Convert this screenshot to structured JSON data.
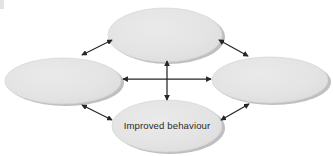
{
  "diagram": {
    "background_color": "#ffffff",
    "node_fill_color": "#e4e4e4",
    "node_shadow_color": "#bdbdbd",
    "node_stroke_color": "#d2d2d2",
    "arrow_color": "#262626",
    "label_color": "#2b2b2b",
    "nodes": [
      {
        "id": "top",
        "label": "",
        "cx": 165,
        "cy": 35,
        "rx": 57,
        "ry": 27
      },
      {
        "id": "left",
        "label": "",
        "cx": 63,
        "cy": 81,
        "rx": 58,
        "ry": 23
      },
      {
        "id": "right",
        "label": "",
        "cx": 270,
        "cy": 80,
        "rx": 58,
        "ry": 23
      },
      {
        "id": "bottom",
        "label": "Improved behaviour",
        "cx": 167,
        "cy": 126,
        "rx": 55,
        "ry": 26
      }
    ],
    "connectors": [
      {
        "id": "center-horizontal",
        "kind": "double-headed-arrow",
        "from": "left",
        "to": "right",
        "x1": 123,
        "y1": 79,
        "x2": 211,
        "y2": 79
      },
      {
        "id": "center-vertical",
        "kind": "double-headed-arrow",
        "from": "top",
        "to": "bottom",
        "x1": 167,
        "y1": 61,
        "x2": 167,
        "y2": 100
      },
      {
        "id": "top-left-diagonal",
        "kind": "double-headed-arrow",
        "from": "left",
        "to": "top",
        "x1": 82,
        "y1": 55,
        "x2": 112,
        "y2": 40
      },
      {
        "id": "top-right-diagonal",
        "kind": "double-headed-arrow",
        "from": "top",
        "to": "right",
        "x1": 219,
        "y1": 40,
        "x2": 248,
        "y2": 56
      },
      {
        "id": "bottom-left-diagonal",
        "kind": "double-headed-arrow",
        "from": "left",
        "to": "bottom",
        "x1": 82,
        "y1": 105,
        "x2": 112,
        "y2": 120
      },
      {
        "id": "bottom-right-diagonal",
        "kind": "double-headed-arrow",
        "from": "bottom",
        "to": "right",
        "x1": 221,
        "y1": 120,
        "x2": 249,
        "y2": 104
      }
    ]
  }
}
